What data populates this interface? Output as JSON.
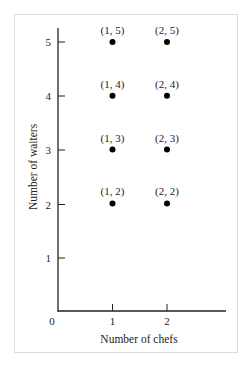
{
  "chart_data": {
    "type": "scatter",
    "title": "",
    "xlabel": "Number of chefs",
    "ylabel": "Number of waiters",
    "xlim": [
      0,
      2.9
    ],
    "ylim": [
      0,
      5.3
    ],
    "x_ticks": [
      "0",
      "1",
      "2"
    ],
    "y_ticks": [
      "1",
      "2",
      "3",
      "4",
      "5"
    ],
    "grid": false,
    "legend": null,
    "points": [
      {
        "x": 1,
        "y": 5,
        "label": "(1, 5)"
      },
      {
        "x": 2,
        "y": 5,
        "label": "(2, 5)"
      },
      {
        "x": 1,
        "y": 4,
        "label": "(1, 4)"
      },
      {
        "x": 2,
        "y": 4,
        "label": "(2, 4)"
      },
      {
        "x": 1,
        "y": 3,
        "label": "(1, 3)"
      },
      {
        "x": 2,
        "y": 3,
        "label": "(2, 3)"
      },
      {
        "x": 1,
        "y": 2,
        "label": "(1, 2)"
      },
      {
        "x": 2,
        "y": 2,
        "label": "(2, 2)"
      }
    ],
    "colors": {
      "point": "#000000",
      "axis": "#222222",
      "frame": "#dcdcdc"
    }
  }
}
